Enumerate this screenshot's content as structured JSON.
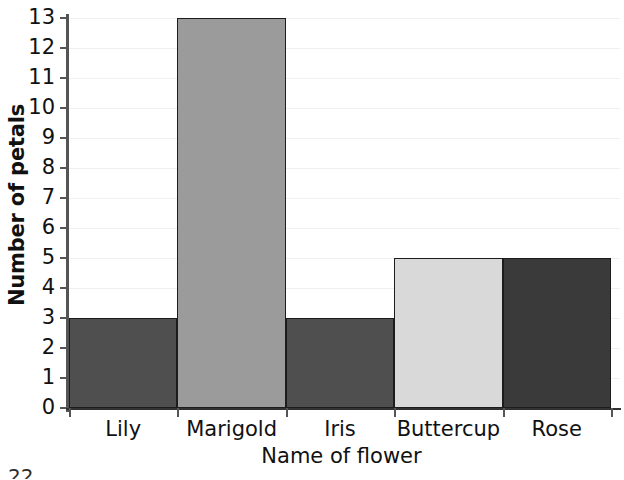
{
  "chart_data": {
    "type": "bar",
    "title": "",
    "xlabel": "Name of flower",
    "ylabel": "Number of petals",
    "categories": [
      "Lily",
      "Marigold",
      "Iris",
      "Buttercup",
      "Rose"
    ],
    "values": [
      3,
      13,
      3,
      5,
      5
    ],
    "ylim": [
      0,
      13
    ],
    "ytick_labels": [
      "0",
      "1",
      "2",
      "3",
      "4",
      "5",
      "6",
      "7",
      "8",
      "9",
      "10",
      "11",
      "12",
      "13"
    ],
    "ytick_values": [
      0,
      1,
      2,
      3,
      4,
      5,
      6,
      7,
      8,
      9,
      10,
      11,
      12,
      13
    ],
    "grid": true,
    "legend": "none",
    "bar_colors": [
      "#4f4f4f",
      "#9b9b9b",
      "#4f4f4f",
      "#d9d9d9",
      "#3a3a3a"
    ],
    "bar_edge_color": "#1c1c1c",
    "gridline_color": "#f0f0f0",
    "axis_color": "#555555",
    "series": [
      {
        "name": "Number of petals",
        "values": [
          3,
          13,
          3,
          5,
          5
        ]
      }
    ]
  },
  "footer": {
    "page_artifact": "22"
  }
}
